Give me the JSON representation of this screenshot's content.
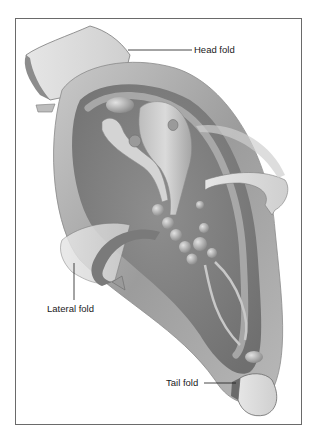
{
  "figure": {
    "labels": {
      "head": "Head fold",
      "lateral": "Lateral fold",
      "tail": "Tail fold"
    },
    "colors": {
      "frame": "#6a6a6a",
      "leader_line": "#1a1a1a",
      "tissue_light": "#d8d8d8",
      "tissue_mid": "#a9a9a9",
      "tissue_dark": "#6e6e6e",
      "background": "#ffffff"
    }
  }
}
